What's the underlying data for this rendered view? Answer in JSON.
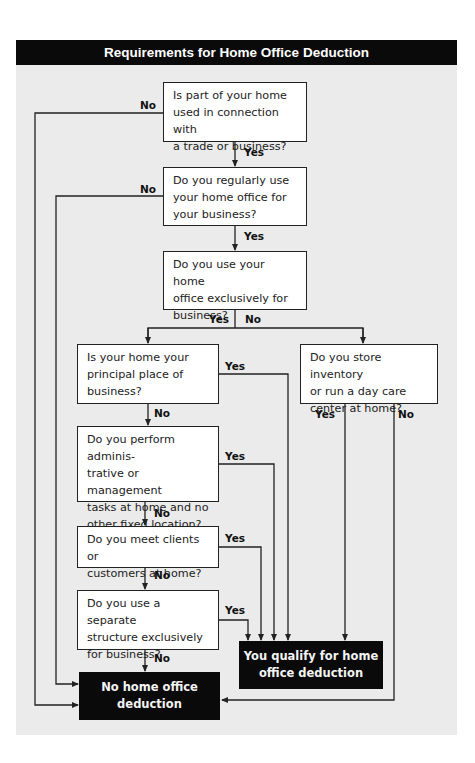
{
  "title": "Requirements for Home Office Deduction",
  "questions": {
    "q1": "Is part of your home\nused in connection with\na trade or business?",
    "q2": "Do you regularly use\nyour home office for\nyour business?",
    "q3": "Do you use your home\noffice exclusively for\nbusiness?",
    "q4": "Is your home your\nprincipal place of\nbusiness?",
    "q5": "Do you perform adminis-\ntrative or management\ntasks at home and no\nother fixed location?",
    "q6": "Do you meet clients or\ncustomers at home?",
    "q7": "Do you use a separate\nstructure exclusively\nfor business?",
    "q8": "Do you store inventory\nor run a day care\ncenter at home?"
  },
  "outcomes": {
    "qualify": "You qualify for home\noffice deduction",
    "no_deduction": "No home office\ndeduction"
  },
  "labels": {
    "yes": "Yes",
    "no": "No"
  },
  "colors": {
    "header_bg": "#0a0a0a",
    "panel_bg": "#ebebeb",
    "line": "#222222"
  }
}
